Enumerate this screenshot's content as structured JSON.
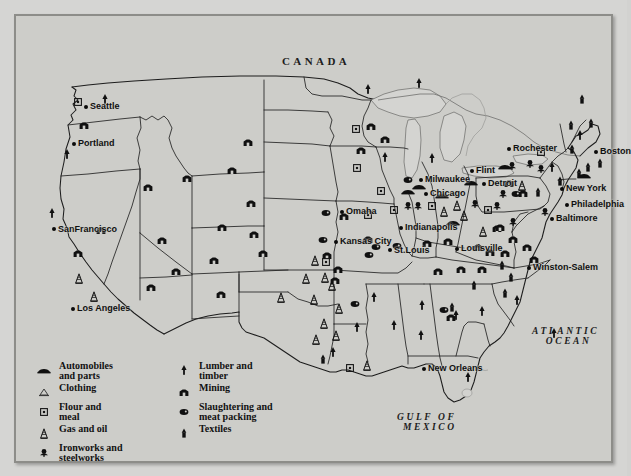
{
  "map": {
    "title": "United States industry and resources map",
    "region_labels": [
      {
        "name": "canada",
        "text": "CANADA"
      },
      {
        "name": "atlantic-ocean",
        "line1": "ATLANTIC",
        "line2": "OCEAN"
      },
      {
        "name": "gulf-of-mexico",
        "line1": "GULF  OF",
        "line2": "MEXICO"
      }
    ],
    "cities": [
      {
        "name": "seattle",
        "label": "Seattle",
        "x": 70,
        "y": 91,
        "anchor": "left"
      },
      {
        "name": "portland",
        "label": "Portland",
        "x": 58,
        "y": 128,
        "anchor": "left"
      },
      {
        "name": "san-francisco",
        "label": "San\nFrancisco",
        "x": 38,
        "y": 213,
        "anchor": "left"
      },
      {
        "name": "los-angeles",
        "label": "Los Angeles",
        "x": 57,
        "y": 293,
        "anchor": "left"
      },
      {
        "name": "omaha",
        "label": "Omaha",
        "x": 326,
        "y": 196,
        "anchor": "left"
      },
      {
        "name": "kansas-city",
        "label": "Kansas City",
        "x": 320,
        "y": 226,
        "anchor": "left"
      },
      {
        "name": "st-louis",
        "label": "St.\nLouis",
        "x": 374,
        "y": 234,
        "anchor": "left"
      },
      {
        "name": "milwaukee",
        "label": "Milwaukee",
        "x": 405,
        "y": 164,
        "anchor": "left"
      },
      {
        "name": "chicago",
        "label": "Chicago",
        "x": 410,
        "y": 178,
        "anchor": "left"
      },
      {
        "name": "indianapolis",
        "label": "Indianapolis",
        "x": 385,
        "y": 212,
        "anchor": "left"
      },
      {
        "name": "louisville",
        "label": "Louisville",
        "x": 441,
        "y": 233,
        "anchor": "left"
      },
      {
        "name": "flint",
        "label": "Flint",
        "x": 456,
        "y": 155,
        "anchor": "left"
      },
      {
        "name": "detroit",
        "label": "Detroit",
        "x": 468,
        "y": 168,
        "anchor": "left"
      },
      {
        "name": "rochester",
        "label": "Rochester",
        "x": 493,
        "y": 133,
        "anchor": "left"
      },
      {
        "name": "boston",
        "label": "Boston",
        "x": 580,
        "y": 136,
        "anchor": "left"
      },
      {
        "name": "new-york",
        "label": "New York",
        "x": 546,
        "y": 173,
        "anchor": "left"
      },
      {
        "name": "philadelphia",
        "label": "Philadelphia",
        "x": 551,
        "y": 189,
        "anchor": "left"
      },
      {
        "name": "baltimore",
        "label": "Baltimore",
        "x": 536,
        "y": 203,
        "anchor": "left"
      },
      {
        "name": "winston-salem",
        "label": "Winston-Salem",
        "x": 513,
        "y": 252,
        "anchor": "left"
      },
      {
        "name": "new-orleans",
        "label": "New Orleans",
        "x": 408,
        "y": 353,
        "anchor": "left"
      }
    ],
    "legend": {
      "column_a": [
        {
          "name": "automobiles-and-parts",
          "symbol": "automobile-icon",
          "line1": "Automobiles",
          "line2": "and parts"
        },
        {
          "name": "clothing",
          "symbol": "clothing-icon",
          "line1": "Clothing",
          "line2": ""
        },
        {
          "name": "flour-and-meal",
          "symbol": "flour-icon",
          "line1": "Flour and",
          "line2": "meal"
        },
        {
          "name": "gas-and-oil",
          "symbol": "oil-derrick-icon",
          "line1": "Gas and oil",
          "line2": ""
        },
        {
          "name": "ironworks-and-steelworks",
          "symbol": "ironworks-icon",
          "line1": "Ironworks and",
          "line2": "steelworks"
        }
      ],
      "column_b": [
        {
          "name": "lumber-and-timber",
          "symbol": "lumber-icon",
          "line1": "Lumber and",
          "line2": "timber"
        },
        {
          "name": "mining",
          "symbol": "mining-icon",
          "line1": "Mining",
          "line2": ""
        },
        {
          "name": "slaughtering-and-meat-packing",
          "symbol": "meat-icon",
          "line1": "Slaughtering and",
          "line2": "meat packing"
        },
        {
          "name": "textiles",
          "symbol": "textile-icon",
          "line1": "Textiles",
          "line2": ""
        }
      ]
    }
  },
  "colors": {
    "paper": "#d5d5d3",
    "plate_fill": "#cdcdc9",
    "land_fill": "#c9c9c5",
    "ink": "#111111",
    "border": "#8d8d89"
  }
}
